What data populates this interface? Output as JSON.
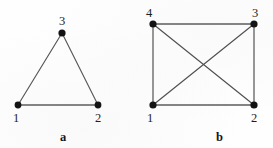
{
  "figure": {
    "width": 273,
    "height": 148,
    "background_color": "#fefefe",
    "edge_color": "#4a4a4a",
    "vertex_color": "#141414",
    "label_color": "#1d1d1d",
    "caption_color": "#141414"
  },
  "panels": [
    {
      "caption": "a",
      "caption_x": 60,
      "caption_y": 131,
      "vertices": [
        {
          "label": "1",
          "x": 18,
          "y": 105,
          "label_x": 13,
          "label_y": 112
        },
        {
          "label": "2",
          "x": 98,
          "y": 105,
          "label_x": 95,
          "label_y": 112
        },
        {
          "label": "3",
          "x": 62,
          "y": 33,
          "label_x": 59,
          "label_y": 15
        }
      ],
      "edges": [
        {
          "from": "1",
          "to": "3"
        },
        {
          "from": "3",
          "to": "2"
        },
        {
          "from": "1",
          "to": "2"
        }
      ]
    },
    {
      "caption": "b",
      "caption_x": 216,
      "caption_y": 131,
      "vertices": [
        {
          "label": "4",
          "x": 153,
          "y": 24,
          "label_x": 146,
          "label_y": 7
        },
        {
          "label": "3",
          "x": 254,
          "y": 24,
          "label_x": 252,
          "label_y": 7
        },
        {
          "label": "1",
          "x": 153,
          "y": 105,
          "label_x": 147,
          "label_y": 112
        },
        {
          "label": "2",
          "x": 254,
          "y": 105,
          "label_x": 251,
          "label_y": 112
        }
      ],
      "edges": [
        {
          "from": "4",
          "to": "3"
        },
        {
          "from": "4",
          "to": "1"
        },
        {
          "from": "3",
          "to": "2"
        },
        {
          "from": "1",
          "to": "2"
        },
        {
          "from": "4",
          "to": "2"
        },
        {
          "from": "1",
          "to": "3"
        }
      ]
    }
  ]
}
